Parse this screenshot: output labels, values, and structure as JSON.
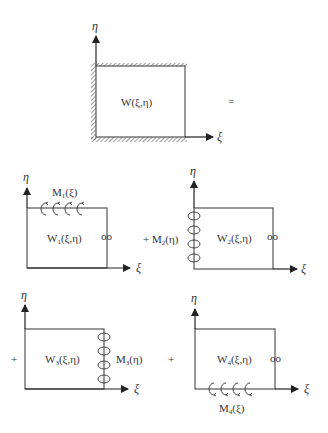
{
  "diagram": {
    "top": {
      "function_label": "W(ξ,η)",
      "x_axis": "ξ",
      "y_axis": "η",
      "equals": "=",
      "boundary": "clamped edges (hatched) on left and bottom"
    },
    "panels": [
      {
        "id": 1,
        "prefix": "",
        "function_label": "W",
        "sub": "1",
        "args": "(ξ,η)",
        "moment_label": "M",
        "moment_sub": "1",
        "moment_args": "(ξ)",
        "moment_edge": "top",
        "free_edge_symbol": "oo",
        "x_axis": "ξ",
        "y_axis": "η"
      },
      {
        "id": 2,
        "prefix": "+",
        "function_label": "W",
        "sub": "2",
        "args": "(ξ,η)",
        "moment_label": "M",
        "moment_sub": "2",
        "moment_args": "(η)",
        "moment_edge": "left",
        "free_edge_symbol": "oo",
        "x_axis": "ξ",
        "y_axis": "η"
      },
      {
        "id": 3,
        "prefix": "+",
        "function_label": "W",
        "sub": "3",
        "args": "(ξ,η)",
        "moment_label": "M",
        "moment_sub": "3",
        "moment_args": "(η)",
        "moment_edge": "right",
        "free_edge_symbol": "",
        "x_axis": "ξ",
        "y_axis": "η"
      },
      {
        "id": 4,
        "prefix": "+",
        "function_label": "W",
        "sub": "4",
        "args": "(ξ,η)",
        "moment_label": "M",
        "moment_sub": "4",
        "moment_args": "(ξ)",
        "moment_edge": "bottom",
        "free_edge_symbol": "oo",
        "x_axis": "ξ",
        "y_axis": "η"
      }
    ],
    "colors": {
      "line": "#444444",
      "text": "#333333",
      "background": "#ffffff"
    }
  }
}
